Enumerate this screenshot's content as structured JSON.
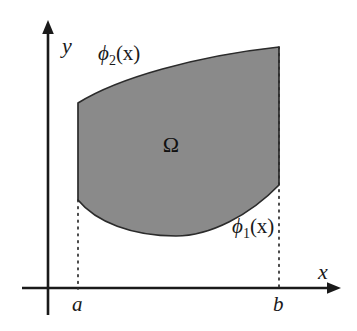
{
  "figure": {
    "kind": "math-region-diagram",
    "background_color": "#ffffff",
    "ink_color": "#1a1a1a",
    "region_fill_color": "#8a8a8a",
    "region_stroke_color": "#2b2b2b"
  },
  "axes": {
    "x_axis_label": "x",
    "y_axis_label": "y",
    "origin_px": {
      "x": 48,
      "y": 288
    },
    "x_axis_y_px": 288,
    "y_axis_x_px": 48,
    "x_axis_tip_px": {
      "x": 340,
      "y": 288
    },
    "y_axis_tip_px": {
      "x": 48,
      "y": 22
    }
  },
  "ticks": [
    {
      "name": "a",
      "label": "a",
      "x_px": 78
    },
    {
      "name": "b",
      "label": "b",
      "x_px": 279
    }
  ],
  "curves": {
    "upper": {
      "name": "phi2",
      "label_base": "ϕ",
      "label_sub": "2",
      "label_arg": "(x)",
      "label_full": "ϕ2(x)",
      "description": "upper boundary curve of the region"
    },
    "lower": {
      "name": "phi1",
      "label_base": "ϕ",
      "label_sub": "1",
      "label_arg": "(x)",
      "label_full": "ϕ1(x)",
      "description": "lower boundary curve of the region"
    }
  },
  "region": {
    "name": "Omega",
    "label": "Ω",
    "label_position_px": {
      "x": 171,
      "y": 152
    },
    "left_edge_x_px": 78,
    "right_edge_x_px": 279,
    "top_left_px": {
      "x": 78,
      "y": 103
    },
    "top_right_px": {
      "x": 279,
      "y": 47
    },
    "bottom_left_px": {
      "x": 78,
      "y": 200
    },
    "bottom_right_px": {
      "x": 279,
      "y": 185
    },
    "lowest_point_px": {
      "x": 176,
      "y": 236
    },
    "path": "M 78 103 C 118 78, 196 56, 279 47 L 279 185 C 250 215, 210 236, 176 236 C 132 236, 96 222, 78 200 Z"
  },
  "guides": [
    {
      "name": "dotted-guide-a",
      "from_px": {
        "x": 78,
        "y": 200
      },
      "to_px": {
        "x": 78,
        "y": 288
      }
    },
    {
      "name": "dotted-guide-b",
      "from_px": {
        "x": 279,
        "y": 47
      },
      "to_px": {
        "x": 279,
        "y": 288
      }
    }
  ],
  "labels": {
    "phi2_position_px": {
      "x": 98,
      "y": 60
    },
    "phi1_position_px": {
      "x": 232,
      "y": 233
    },
    "x_position_px": {
      "x": 318,
      "y": 279
    },
    "y_position_px": {
      "x": 62,
      "y": 53
    },
    "a_position_px": {
      "x": 72,
      "y": 311
    },
    "b_position_px": {
      "x": 273,
      "y": 311
    }
  }
}
